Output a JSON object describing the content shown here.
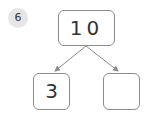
{
  "problem": {
    "number": "6"
  },
  "number_bond": {
    "whole": "10",
    "parts": [
      "3",
      ""
    ]
  },
  "colors": {
    "badge_bg": "#e6e6e6",
    "box_border": "#8c8c8c",
    "arrow": "#8c8c8c"
  }
}
